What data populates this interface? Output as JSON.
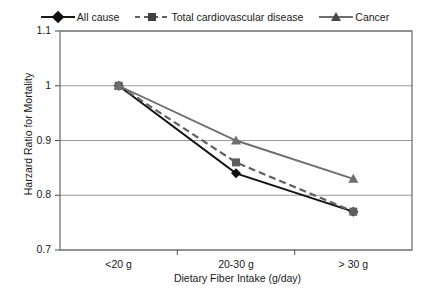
{
  "chart_data": {
    "type": "line",
    "title": "",
    "xlabel": "Dietary Fiber Intake (g/day)",
    "ylabel": "Harzard Ratio for Mortality",
    "categories": [
      "<20 g",
      "20-30 g",
      "> 30 g"
    ],
    "ylim": [
      0.7,
      1.1
    ],
    "yticks": [
      "0.7",
      "0.8",
      "0.9",
      "1",
      "1.1"
    ],
    "ytick_values": [
      0.7,
      0.8,
      0.9,
      1.0,
      1.1
    ],
    "grid": true,
    "legend_position": "top",
    "series": [
      {
        "name": "All cause",
        "values": [
          1.0,
          0.84,
          0.77
        ],
        "color": "#111111",
        "line_style": "solid",
        "marker": "diamond"
      },
      {
        "name": "Total cardiovascular disease",
        "values": [
          1.0,
          0.86,
          0.77
        ],
        "color": "#5f5f5f",
        "line_style": "dashed",
        "marker": "square"
      },
      {
        "name": "Cancer",
        "values": [
          1.0,
          0.9,
          0.83
        ],
        "color": "#6e6e6e",
        "line_style": "solid",
        "marker": "triangle"
      }
    ]
  },
  "legend": {
    "items": [
      {
        "label": "All cause"
      },
      {
        "label": "Total cardiovascular disease"
      },
      {
        "label": "Cancer"
      }
    ]
  },
  "axes": {
    "y_title": "Harzard Ratio for Mortality",
    "x_title": "Dietary Fiber Intake (g/day)",
    "y_ticks": [
      "1.1",
      "1",
      "0.9",
      "0.8",
      "0.7"
    ],
    "x_ticks": [
      "<20 g",
      "20-30 g",
      "> 30 g"
    ]
  }
}
